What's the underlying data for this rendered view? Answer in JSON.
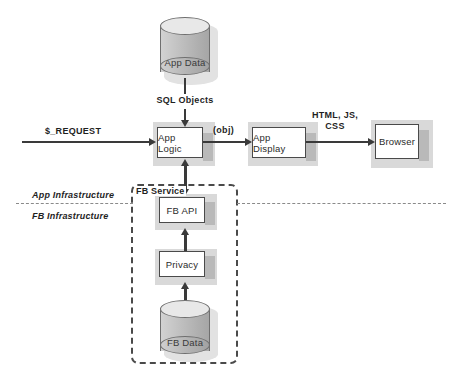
{
  "diagram": {
    "nodes": {
      "app_data": "App Data",
      "app_logic": "App Logic",
      "app_display": "App Display",
      "browser": "Browser",
      "fb_api": "FB API",
      "privacy": "Privacy",
      "fb_data": "FB Data"
    },
    "edge_labels": {
      "request": "$_REQUEST",
      "sql_objects": "SQL Objects",
      "obj": "(obj)",
      "html_js_css_line1": "HTML, JS,",
      "html_js_css_line2": "CSS"
    },
    "group_label": "FB Service",
    "zones": {
      "app_infrastructure": "App Infrastructure",
      "fb_infrastructure": "FB Infrastructure"
    },
    "colors": {
      "stroke": "#3a3a3a",
      "box_fill": "#ffffff",
      "shadow": "#b9b9b9",
      "cylinder_body": "#c2c2c2",
      "cylinder_top": "#e8e8e8",
      "dashed": "#4a4a4a",
      "divider": "#8a8a8a"
    }
  }
}
